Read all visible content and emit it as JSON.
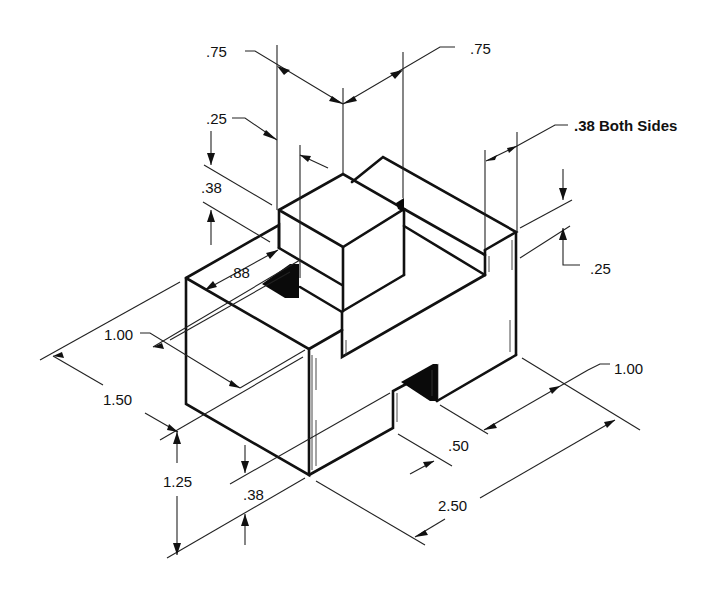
{
  "drawing": {
    "type": "isometric-technical-drawing",
    "subject": "stepped block with center cube, top groove, and bottom slot",
    "units": "inches",
    "line_color": "#111111",
    "background": "#ffffff"
  },
  "dimensions": {
    "cube_width_left": ".75",
    "cube_width_right": ".75",
    "step_offset": ".25",
    "step_height": ".38",
    "groove_width": ".38 Both Sides",
    "groove_depth": ".25",
    "groove_length": ".88",
    "left_depth_inner": "1.00",
    "overall_depth": "1.50",
    "overall_height": "1.25",
    "slot_height": ".38",
    "slot_width": ".50",
    "right_offset": "1.00",
    "overall_length": "2.50"
  }
}
